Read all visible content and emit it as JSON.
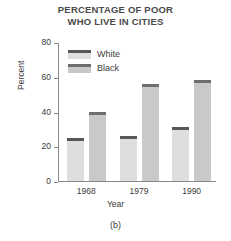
{
  "chart_data": {
    "type": "bar",
    "title": "PERCENTAGE OF POOR WHO LIVE IN CITIES",
    "title_lines": [
      "PERCENTAGE OF POOR",
      "WHO LIVE IN CITIES"
    ],
    "caption": "(b)",
    "xlabel": "Year",
    "ylabel": "Percent",
    "categories": [
      "1968",
      "1979",
      "1990"
    ],
    "ylim": [
      0,
      80
    ],
    "yticks": [
      0,
      20,
      40,
      60,
      80
    ],
    "ytick_labels": [
      "0",
      "20",
      "40",
      "60",
      "80"
    ],
    "grid": false,
    "legend_position": "upper-left-inside",
    "series": [
      {
        "name": "White",
        "values": [
          25,
          26,
          31
        ],
        "fill_color": "#dedede",
        "cap_color": "#585858"
      },
      {
        "name": "Black",
        "values": [
          40,
          56,
          58
        ],
        "fill_color": "#c9c9c9",
        "cap_color": "#6e6e6e"
      }
    ]
  },
  "colors": {
    "axis": "#8a8a8a",
    "text": "#3a3a3a",
    "title": "#4a4a4a",
    "background": "#ffffff"
  }
}
